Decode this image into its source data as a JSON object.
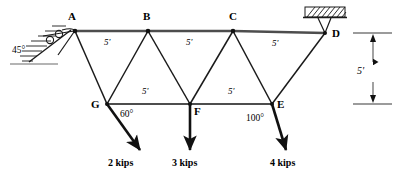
{
  "diagram": {
    "line_color": "#1a1a1a",
    "nodes": [
      {
        "id": "A",
        "label": "A",
        "x": 75,
        "y": 31,
        "label_x": 68,
        "label_y": 14
      },
      {
        "id": "B",
        "label": "B",
        "x": 148,
        "y": 31,
        "label_x": 143,
        "label_y": 14
      },
      {
        "id": "C",
        "label": "C",
        "x": 233,
        "y": 31,
        "label_x": 229,
        "label_y": 14
      },
      {
        "id": "D",
        "label": "D",
        "x": 325,
        "y": 33,
        "label_x": 331,
        "label_y": 28
      },
      {
        "id": "G",
        "label": "G",
        "x": 107,
        "y": 104,
        "label_x": 92,
        "label_y": 100
      },
      {
        "id": "F",
        "label": "F",
        "x": 190,
        "y": 104,
        "label_x": 195,
        "label_y": 106
      },
      {
        "id": "E",
        "label": "E",
        "x": 272,
        "y": 104,
        "label_x": 277,
        "label_y": 99
      }
    ],
    "members": [
      {
        "from": "A",
        "to": "B",
        "chord": "top"
      },
      {
        "from": "B",
        "to": "C",
        "chord": "top"
      },
      {
        "from": "C",
        "to": "D",
        "chord": "top"
      },
      {
        "from": "G",
        "to": "F",
        "chord": "bottom"
      },
      {
        "from": "F",
        "to": "E",
        "chord": "bottom"
      },
      {
        "from": "A",
        "to": "G",
        "chord": "diagonal"
      },
      {
        "from": "B",
        "to": "G",
        "chord": "diagonal"
      },
      {
        "from": "B",
        "to": "F",
        "chord": "diagonal"
      },
      {
        "from": "C",
        "to": "F",
        "chord": "diagonal"
      },
      {
        "from": "C",
        "to": "E",
        "chord": "diagonal"
      },
      {
        "from": "D",
        "to": "E",
        "chord": "diagonal"
      }
    ],
    "dimensions": [
      {
        "id": "dim-ab",
        "text": "5'",
        "x": 105,
        "y": 41
      },
      {
        "id": "dim-bc",
        "text": "5'",
        "x": 186,
        "y": 41
      },
      {
        "id": "dim-cd",
        "text": "5'",
        "x": 272,
        "y": 41
      },
      {
        "id": "dim-gf",
        "text": "5'",
        "x": 142,
        "y": 89
      },
      {
        "id": "dim-fe",
        "text": "5'",
        "x": 228,
        "y": 89
      },
      {
        "id": "dim-vertical",
        "text": "5'",
        "x": 357,
        "y": 72
      }
    ],
    "angles": [
      {
        "id": "angle-support-a",
        "text": "45°",
        "x": 13,
        "y": 48
      },
      {
        "id": "angle-load-g",
        "text": "60°",
        "x": 120,
        "y": 112
      },
      {
        "id": "angle-load-e",
        "text": "100°",
        "x": 248,
        "y": 116
      }
    ],
    "loads": [
      {
        "id": "load-g",
        "label": "2 kips",
        "at_node": "G",
        "tip_x": 141,
        "tip_y": 152,
        "label_x": 108,
        "label_y": 160
      },
      {
        "id": "load-f",
        "label": "3 kips",
        "at_node": "F",
        "tip_x": 190,
        "tip_y": 152,
        "label_x": 172,
        "label_y": 160
      },
      {
        "id": "load-e",
        "label": "4 kips",
        "at_node": "E",
        "tip_x": 287,
        "tip_y": 152,
        "label_x": 272,
        "label_y": 160
      }
    ],
    "supports": {
      "left": {
        "id": "support-a",
        "type": "roller-on-inclined-plane",
        "angle_label": "45°",
        "hatch_count": 7
      },
      "right": {
        "id": "support-d",
        "type": "pin-on-ceiling",
        "hatch_count": 8
      }
    },
    "vertical_dimension": {
      "id": "vertical-dimension-5ft",
      "text": "5'",
      "top_y": 33,
      "bottom_y": 104,
      "line_x": 373
    }
  }
}
